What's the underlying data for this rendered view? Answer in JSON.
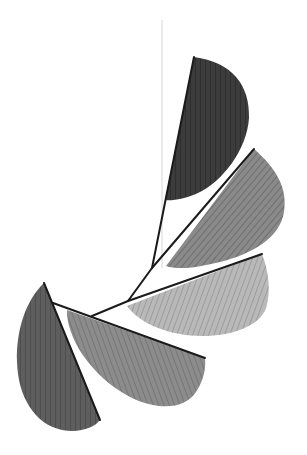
{
  "image": {
    "description": "Hanging mobile sculpture with five gray half-leaf shapes on black wire arms",
    "width": 307,
    "height": 455,
    "background": "#ffffff"
  },
  "string": {
    "x1": 162,
    "y1": 20,
    "x2": 162,
    "y2": 268,
    "color": "#d8d8d8",
    "width": 1
  },
  "wires": [
    {
      "name": "stem-upper",
      "x1": 194,
      "y1": 57,
      "x2": 152,
      "y2": 268
    },
    {
      "name": "arm-leaf-2",
      "x1": 254,
      "y1": 149,
      "x2": 152,
      "y2": 268
    },
    {
      "name": "stem-middle",
      "x1": 152,
      "y1": 268,
      "x2": 128,
      "y2": 301
    },
    {
      "name": "arm-leaf-3",
      "x1": 262,
      "y1": 254,
      "x2": 128,
      "y2": 301
    },
    {
      "name": "stem-lower",
      "x1": 128,
      "y1": 301,
      "x2": 92,
      "y2": 316
    },
    {
      "name": "arm-leaf-4",
      "x1": 53,
      "y1": 303,
      "x2": 205,
      "y2": 358
    },
    {
      "name": "arm-leaf-5",
      "x1": 44,
      "y1": 283,
      "x2": 100,
      "y2": 420
    }
  ],
  "wire_color": "#1a1a1a",
  "leaves": [
    {
      "name": "leaf-1-top",
      "fill": "#3c3c3c",
      "stripe": "#2e2e2e",
      "path": "M194,57 C232,62 250,85 249,118 C247,150 222,182 198,193 C185,199 172,201 165,200 L194,57 Z"
    },
    {
      "name": "leaf-2-upper-right",
      "fill": "#8a8a8a",
      "stripe": "#6e6e6e",
      "path": "M254,149 C276,168 288,188 284,212 C280,238 252,254 220,262 C196,268 178,270 166,266 L254,149 Z"
    },
    {
      "name": "leaf-3-middle-right",
      "fill": "#b9b9b9",
      "stripe": "#9c9c9c",
      "path": "M262,254 C269,272 271,292 266,308 C260,326 232,336 202,336 C170,336 140,324 127,306 L262,254 Z"
    },
    {
      "name": "leaf-4-lower-middle",
      "fill": "#8c8c8c",
      "stripe": "#767676",
      "path": "M67,310 C66,336 90,376 130,397 C160,412 186,408 196,392 C204,380 206,368 205,358 L67,310 Z"
    },
    {
      "name": "leaf-5-lower-left",
      "fill": "#5e5e5e",
      "stripe": "#4e4e4e",
      "path": "M44,283 C26,300 16,330 17,362 C18,396 34,424 62,430 C80,433 94,428 100,420 L44,283 Z"
    }
  ]
}
